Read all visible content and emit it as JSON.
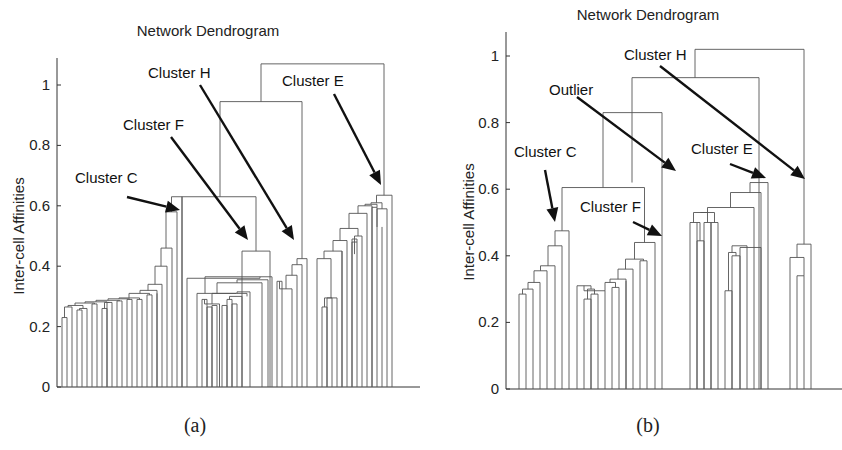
{
  "chart_data": [
    {
      "type": "dendrogram",
      "panel": "(a)",
      "title": "Network Dendrogram",
      "xlabel": "",
      "ylabel": "Inter-cell Affinities",
      "ylim": [
        0,
        1.1
      ],
      "yticks": [
        0,
        0.2,
        0.4,
        0.6,
        0.8,
        1
      ],
      "ytick_labels": [
        "0",
        "0.2",
        "0.4",
        "0.6",
        "0.8",
        "1"
      ],
      "annotations": [
        {
          "text": "Cluster C",
          "label_xy": [
            75,
            183
          ],
          "arrow_from": [
            127,
            197
          ],
          "arrow_to": [
            180,
            210
          ]
        },
        {
          "text": "Cluster F",
          "label_xy": [
            123,
            130
          ],
          "arrow_from": [
            171,
            137
          ],
          "arrow_to": [
            248,
            240
          ]
        },
        {
          "text": "Cluster H",
          "label_xy": [
            148,
            78
          ],
          "arrow_from": [
            200,
            85
          ],
          "arrow_to": [
            294,
            240
          ]
        },
        {
          "text": "Cluster E",
          "label_xy": [
            282,
            86
          ],
          "arrow_from": [
            334,
            94
          ],
          "arrow_to": [
            381,
            185
          ]
        }
      ],
      "leaves_x": [
        62,
        67,
        72,
        77,
        82,
        87,
        92,
        97,
        102,
        107,
        112,
        117,
        122,
        127,
        132,
        137,
        142,
        147,
        152,
        157,
        162,
        167,
        172,
        177,
        182,
        187,
        197,
        202,
        207,
        212,
        217,
        222,
        227,
        232,
        237,
        242,
        247,
        252,
        257,
        262,
        267,
        277,
        282,
        287,
        292,
        297,
        302,
        307,
        317,
        322,
        327,
        332,
        337,
        342,
        347,
        352,
        357,
        362,
        367,
        372,
        377,
        382,
        387,
        392
      ],
      "merges": [
        [
          62,
          67,
          0.23,
          0,
          0
        ],
        [
          64.5,
          72,
          0.265,
          0.23,
          0
        ],
        [
          77,
          82,
          0.255,
          0,
          0
        ],
        [
          79.5,
          87,
          0.26,
          0.255,
          0
        ],
        [
          68,
          83,
          0.27,
          0.265,
          0.26
        ],
        [
          92,
          97,
          0.275,
          0,
          0
        ],
        [
          75,
          94.5,
          0.278,
          0.27,
          0.275
        ],
        [
          102,
          107,
          0.26,
          0,
          0
        ],
        [
          107,
          112,
          0.28,
          0,
          0
        ],
        [
          104.5,
          109.5,
          0.28,
          0.26,
          0.28
        ],
        [
          85,
          107,
          0.282,
          0.278,
          0.28
        ],
        [
          117,
          122,
          0.285,
          0,
          0
        ],
        [
          96,
          119.5,
          0.287,
          0.282,
          0.285
        ],
        [
          127,
          132,
          0.29,
          0,
          0
        ],
        [
          108,
          129.5,
          0.292,
          0.287,
          0.29
        ],
        [
          137,
          142,
          0.29,
          0,
          0
        ],
        [
          119,
          139.5,
          0.295,
          0.292,
          0.29
        ],
        [
          147,
          152,
          0.305,
          0,
          0
        ],
        [
          129,
          149.5,
          0.31,
          0.295,
          0.305
        ],
        [
          157,
          0,
          0.31,
          0,
          0
        ],
        [
          140,
          157,
          0.32,
          0.31,
          0
        ],
        [
          148,
          162,
          0.34,
          0.32,
          0
        ],
        [
          155,
          167,
          0.4,
          0.34,
          0
        ],
        [
          161,
          172,
          0.46,
          0.4,
          0
        ],
        [
          166,
          177,
          0.58,
          0.46,
          0
        ],
        [
          171.5,
          182,
          0.63,
          0.58,
          0
        ],
        [
          202,
          207,
          0.29,
          0,
          0
        ],
        [
          207,
          212,
          0.265,
          0,
          0
        ],
        [
          212,
          217,
          0.27,
          0,
          0
        ],
        [
          222,
          227,
          0.27,
          0,
          0
        ],
        [
          227,
          232,
          0.29,
          0,
          0
        ],
        [
          232,
          237,
          0.275,
          0,
          0
        ],
        [
          204.5,
          219.5,
          0.275,
          0.29,
          0
        ],
        [
          229.5,
          242,
          0.3,
          0.29,
          0
        ],
        [
          212,
          247,
          0.31,
          0.275,
          0.3
        ],
        [
          237,
          250,
          0.315,
          0.31,
          0
        ],
        [
          197,
          236,
          0.31,
          0,
          0.31
        ],
        [
          217,
          262,
          0.345,
          0.31,
          0
        ],
        [
          237,
          268,
          0.355,
          0.345,
          0
        ],
        [
          205,
          272,
          0.365,
          0.31,
          0
        ],
        [
          187,
          260,
          0.36,
          0,
          0.365
        ],
        [
          242,
          270,
          0.45,
          0,
          0
        ],
        [
          182,
          256,
          0.63,
          0,
          0.45
        ],
        [
          277,
          282,
          0.35,
          0,
          0
        ],
        [
          279.5,
          292,
          0.325,
          0.35,
          0
        ],
        [
          286,
          297,
          0.37,
          0.325,
          0
        ],
        [
          292,
          302,
          0.405,
          0.37,
          0
        ],
        [
          297,
          307,
          0.425,
          0.405,
          0
        ],
        [
          220,
          302,
          0.945,
          0.63,
          0.425
        ],
        [
          322,
          327,
          0.265,
          0,
          0
        ],
        [
          327,
          332,
          0.295,
          0,
          0
        ],
        [
          324.5,
          337,
          0.295,
          0.265,
          0
        ],
        [
          317,
          331,
          0.425,
          0,
          0.295
        ],
        [
          342,
          0,
          0.45,
          0,
          0
        ],
        [
          324,
          342,
          0.45,
          0.425,
          0
        ],
        [
          333,
          347,
          0.485,
          0.45,
          0
        ],
        [
          352,
          357,
          0.49,
          0,
          0
        ],
        [
          352,
          357,
          0.48,
          0,
          0.48
        ],
        [
          354.5,
          362,
          0.5,
          0.44,
          0
        ],
        [
          340,
          358,
          0.525,
          0.485,
          0.5
        ],
        [
          349,
          367,
          0.575,
          0.525,
          0
        ],
        [
          358,
          372,
          0.6,
          0.575,
          0
        ],
        [
          372,
          377,
          0.595,
          0,
          0
        ],
        [
          365,
          377,
          0.605,
          0.6,
          0.595
        ],
        [
          382,
          0,
          0.53,
          0,
          0
        ],
        [
          377,
          387,
          0.59,
          0.53,
          0
        ],
        [
          371,
          382,
          0.61,
          0.605,
          0.59
        ],
        [
          376.5,
          392,
          0.635,
          0.61,
          0
        ],
        [
          261,
          384,
          1.07,
          0.945,
          0.635
        ]
      ]
    },
    {
      "type": "dendrogram",
      "panel": "(b)",
      "title": "Network Dendrogram",
      "xlabel": "",
      "ylabel": "Inter-cell Affinities",
      "ylim": [
        0,
        1.05
      ],
      "yticks": [
        0,
        0.2,
        0.4,
        0.6,
        0.8,
        1
      ],
      "ytick_labels": [
        "0",
        "0.2",
        "0.4",
        "0.6",
        "0.8",
        "1"
      ],
      "annotations": [
        {
          "text": "Cluster C",
          "label_xy": [
            514,
            157
          ],
          "arrow_from": [
            545,
            170
          ],
          "arrow_to": [
            555,
            222
          ]
        },
        {
          "text": "Outlier",
          "label_xy": [
            549,
            95
          ],
          "arrow_from": [
            577,
            97
          ],
          "arrow_to": [
            676,
            171
          ]
        },
        {
          "text": "Cluster F",
          "label_xy": [
            580,
            212
          ],
          "arrow_from": [
            633,
            222
          ],
          "arrow_to": [
            662,
            236
          ]
        },
        {
          "text": "Cluster H",
          "label_xy": [
            624,
            60
          ],
          "arrow_from": [
            660,
            66
          ],
          "arrow_to": [
            805,
            179
          ]
        },
        {
          "text": "Cluster E",
          "label_xy": [
            691,
            154
          ],
          "arrow_from": [
            730,
            164
          ],
          "arrow_to": [
            766,
            178
          ]
        },
        {
          "text": "",
          "label_xy": [
            0,
            0
          ],
          "arrow_from": [
            0,
            0
          ],
          "arrow_to": [
            0,
            0
          ]
        }
      ],
      "leaves_x": [
        519,
        526,
        533,
        540,
        547,
        555,
        562,
        569,
        577,
        584,
        591,
        598,
        605,
        612,
        619,
        626,
        633,
        640,
        647,
        655,
        662,
        669,
        676,
        683,
        690,
        697,
        704,
        711,
        718,
        725,
        732,
        740,
        747,
        754,
        761,
        768,
        775,
        782,
        790,
        797,
        804,
        811,
        818
      ],
      "merges": [
        [
          519,
          526,
          0.285,
          0,
          0
        ],
        [
          522.5,
          533,
          0.3,
          0.285,
          0
        ],
        [
          528,
          540,
          0.32,
          0.3,
          0
        ],
        [
          534,
          547,
          0.355,
          0.32,
          0
        ],
        [
          540.5,
          555,
          0.37,
          0.355,
          0
        ],
        [
          548,
          562,
          0.43,
          0.37,
          0
        ],
        [
          555,
          569,
          0.475,
          0.43,
          0
        ],
        [
          584,
          591,
          0.27,
          0,
          0
        ],
        [
          591,
          598,
          0.285,
          0,
          0
        ],
        [
          587.5,
          594.5,
          0.3,
          0.27,
          0.285
        ],
        [
          577,
          591,
          0.31,
          0,
          0.3
        ],
        [
          584,
          605,
          0.295,
          0.31,
          0
        ],
        [
          612,
          619,
          0.305,
          0,
          0
        ],
        [
          605,
          615.5,
          0.32,
          0.295,
          0.305
        ],
        [
          626,
          0,
          0.325,
          0,
          0
        ],
        [
          610,
          626,
          0.33,
          0.32,
          0
        ],
        [
          618,
          633,
          0.36,
          0.33,
          0
        ],
        [
          640,
          647,
          0.385,
          0,
          0
        ],
        [
          625.5,
          643.5,
          0.39,
          0.36,
          0.385
        ],
        [
          634.5,
          655,
          0.44,
          0.39,
          0
        ],
        [
          562,
          644.5,
          0.605,
          0.475,
          0.44
        ],
        [
          690,
          697,
          0.5,
          0,
          0
        ],
        [
          697,
          704,
          0.445,
          0,
          0
        ],
        [
          697,
          700,
          0.5,
          0.5,
          0.445
        ],
        [
          704,
          711,
          0.5,
          0,
          0
        ],
        [
          693.5,
          707.5,
          0.53,
          0.5,
          0.5
        ],
        [
          711,
          718,
          0.5,
          0,
          0
        ],
        [
          700.5,
          714.5,
          0.53,
          0.53,
          0.5
        ],
        [
          725,
          732,
          0.295,
          0,
          0
        ],
        [
          732,
          740,
          0.4,
          0,
          0
        ],
        [
          728.5,
          736,
          0.41,
          0.295,
          0.4
        ],
        [
          732,
          747,
          0.43,
          0.41,
          0
        ],
        [
          707.5,
          754,
          0.545,
          0.53,
          0
        ],
        [
          740,
          761,
          0.425,
          0,
          0
        ],
        [
          730.5,
          761,
          0.59,
          0.545,
          0
        ],
        [
          750,
          768,
          0.62,
          0.59,
          0
        ],
        [
          797,
          804,
          0.34,
          0,
          0
        ],
        [
          790,
          804,
          0.395,
          0,
          0.34
        ],
        [
          797,
          811,
          0.435,
          0.395,
          0
        ],
        [
          603,
          662,
          0.83,
          0.605,
          0
        ],
        [
          632,
          759,
          0.935,
          0.62,
          0
        ],
        [
          695,
          804,
          1.02,
          0.935,
          0.435
        ]
      ]
    }
  ],
  "panels": [
    {
      "title": "Network Dendrogram",
      "caption": "(a)",
      "ylabel": "Inter-cell Affinities"
    },
    {
      "title": "Network Dendrogram",
      "caption": "(b)",
      "ylabel": "Inter-cell Affinities"
    }
  ]
}
